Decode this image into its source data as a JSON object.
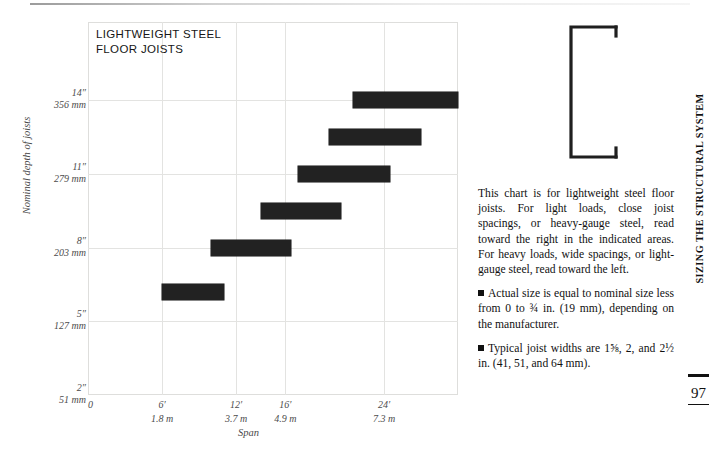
{
  "page": {
    "running_head": "SIZING THE STRUCTURAL SYSTEM",
    "folio": "97"
  },
  "figure": {
    "name": "c-channel-steel-joist-section",
    "stroke_color": "#1f1f1f"
  },
  "body": {
    "paragraphs": [
      "This chart is for lightweight steel floor joists. For light loads, close joist spacings, or heavy-gauge steel, read toward the right in the indicated areas. For heavy loads, wide spacings, or light-gauge steel, read toward the left.",
      "Actual size is equal to nominal size less from 0 to ¾ in. (19 mm), depending on the manufacturer.",
      "Typical joist widths are 1⅝, 2, and 2½ in. (41, 51, and 64 mm)."
    ],
    "bullet_glyph": "■"
  },
  "chart_data": {
    "type": "bar",
    "orientation": "horizontal-range",
    "title": "LIGHTWEIGHT STEEL\nFLOOR JOISTS",
    "xlabel": "Span",
    "ylabel": "Nominal depth of joists",
    "grid": true,
    "legend": null,
    "bar_color": "#222222",
    "xlim_ft": [
      0,
      30
    ],
    "xticks": [
      {
        "ft": "0",
        "m": "",
        "value": 0
      },
      {
        "ft": "6′",
        "m": "1.8 m",
        "value": 6
      },
      {
        "ft": "12′",
        "m": "3.7 m",
        "value": 12
      },
      {
        "ft": "16′",
        "m": "4.9 m",
        "value": 16
      },
      {
        "ft": "24′",
        "m": "7.3 m",
        "value": 24
      }
    ],
    "yticks": [
      {
        "in": "14″",
        "mm": "356 mm",
        "value": 14
      },
      {
        "in": "11″",
        "mm": "279 mm",
        "value": 11
      },
      {
        "in": "8″",
        "mm": "203 mm",
        "value": 8
      },
      {
        "in": "5″",
        "mm": "127 mm",
        "value": 5
      },
      {
        "in": "2″",
        "mm": "51 mm",
        "value": 2
      }
    ],
    "bars": [
      {
        "label": "14 in. / 356 mm joist",
        "depth_in": 14,
        "span_start_ft": 21.5,
        "span_end_ft": 30.0
      },
      {
        "label": "12 in. joist",
        "depth_in": 12.5,
        "span_start_ft": 19.5,
        "span_end_ft": 27.0
      },
      {
        "label": "11 in. / 279 mm joist",
        "depth_in": 11,
        "span_start_ft": 17.0,
        "span_end_ft": 24.5
      },
      {
        "label": "9 in. joist",
        "depth_in": 9.5,
        "span_start_ft": 14.0,
        "span_end_ft": 20.5
      },
      {
        "label": "8 in. / 203 mm joist",
        "depth_in": 8,
        "span_start_ft": 10.0,
        "span_end_ft": 16.5
      },
      {
        "label": "6 in. joist",
        "depth_in": 6.2,
        "span_start_ft": 6.0,
        "span_end_ft": 11.0
      }
    ]
  }
}
